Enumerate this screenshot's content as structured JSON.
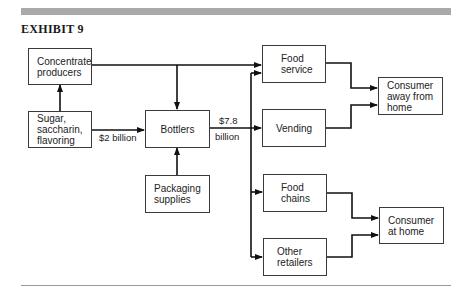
{
  "exhibit": {
    "title": "EXHIBIT 9",
    "band_color": "#a9a9a9"
  },
  "nodes": {
    "concentrate": "Concentrate\nproducers",
    "sugar": "Sugar,\nsaccharin,\nflavoring",
    "bottlers": "Bottlers",
    "packaging": "Packaging\nsupplies",
    "food_service": "Food\nservice",
    "vending": "Vending",
    "food_chains": "Food\nchains",
    "other_retailers": "Other\nretailers",
    "consumer_away": "Consumer\naway from\nhome",
    "consumer_home": "Consumer\nat home"
  },
  "edge_labels": {
    "sugar_to_bottlers": "$2 billion",
    "bottlers_out_1": "$7.8",
    "bottlers_out_2": "billion"
  },
  "edges": [
    {
      "from": "sugar",
      "to": "concentrate"
    },
    {
      "from": "sugar",
      "to": "bottlers",
      "label": "$2 billion"
    },
    {
      "from": "concentrate",
      "to": "bottlers"
    },
    {
      "from": "concentrate",
      "to": "food_service"
    },
    {
      "from": "packaging",
      "to": "bottlers"
    },
    {
      "from": "bottlers",
      "to": "food_service",
      "label": "$7.8 billion"
    },
    {
      "from": "bottlers",
      "to": "vending",
      "label": "$7.8 billion"
    },
    {
      "from": "bottlers",
      "to": "food_chains",
      "label": "$7.8 billion"
    },
    {
      "from": "bottlers",
      "to": "other_retailers",
      "label": "$7.8 billion"
    },
    {
      "from": "food_service",
      "to": "consumer_away"
    },
    {
      "from": "vending",
      "to": "consumer_away"
    },
    {
      "from": "food_chains",
      "to": "consumer_home"
    },
    {
      "from": "other_retailers",
      "to": "consumer_home"
    }
  ]
}
